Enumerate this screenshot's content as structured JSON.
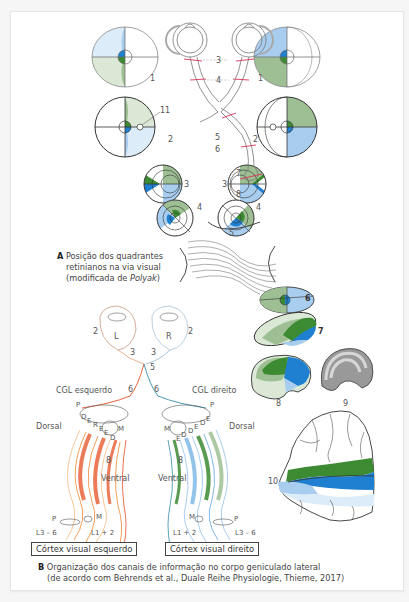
{
  "figure": {
    "panel_a": {
      "letter": "A",
      "caption_line1": "Posição dos quadrantes",
      "caption_line2": "retinianos na via visual",
      "caption_line3_prefix": "(modificada de ",
      "caption_line3_italic": "Polyak",
      "caption_line3_suffix": ")",
      "numbers": [
        "1",
        "2",
        "3",
        "4",
        "5",
        "6",
        "7",
        "8",
        "9",
        "10",
        "11"
      ]
    },
    "panel_b": {
      "letter": "B",
      "caption_line1": "Organização dos canais de informação no corpo geniculado lateral",
      "caption_line2": "(de acordo com Behrends et al., Duale Reihe Physiologie, Thieme, 2017)",
      "eye_left": "L",
      "eye_right": "R",
      "cgl_left": "CGL esquerdo",
      "cgl_right": "CGL direito",
      "dorsal": "Dorsal",
      "ventral": "Ventral",
      "p": "P",
      "m": "M",
      "l36": "L3 – 6",
      "l12": "L1 + 2",
      "cortex_left": "Córtex visual esquerdo",
      "cortex_right": "Córtex visual direito",
      "layer_letters_left": [
        "D",
        "E",
        "R",
        "E",
        "E",
        "D"
      ],
      "layer_letters_right": [
        "E",
        "D",
        "D",
        "E",
        "D",
        "E"
      ]
    },
    "colors": {
      "light_blue": "#a8cdef",
      "blue": "#1f7fd0",
      "light_green": "#9dbf93",
      "green": "#3c8a32",
      "pale_blue": "#dcecf8",
      "pale_green": "#dbe8d6",
      "red_orange": "#e8643c",
      "orange": "#f2a05a",
      "grey": "#8a8a8a",
      "marker_red": "#d8345a"
    }
  }
}
